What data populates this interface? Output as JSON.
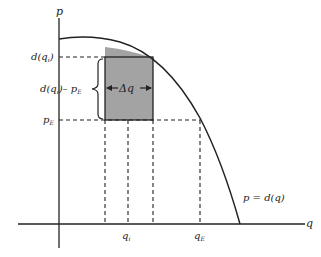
{
  "diagram": {
    "axes": {
      "y_label": "p",
      "x_label": "q"
    },
    "curve_label": "p = d(q)",
    "y_markers": {
      "d_qi": "d(q",
      "d_qi_sub": "i",
      "d_qi_close": ")",
      "diff_label": "d(q",
      "diff_sub": "i",
      "diff_rest": ")– p",
      "diff_sub_E": "E",
      "pE": "p",
      "pE_sub": "E"
    },
    "x_markers": {
      "qi": "q",
      "qi_sub": "i",
      "qE": "q",
      "qE_sub": "E"
    },
    "rect_label": "Δq",
    "colors": {
      "shade": "#a0a0a0",
      "line": "#222222"
    }
  }
}
